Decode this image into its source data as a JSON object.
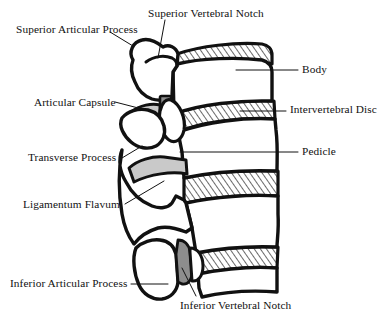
{
  "figure": {
    "background_color": "#ffffff",
    "ink_color": "#111111",
    "labels": [
      {
        "id": "superior-articular-process",
        "text": "Superior Articular Process",
        "x": 16,
        "y": 24,
        "align": "left"
      },
      {
        "id": "superior-vertebral-notch",
        "text": "Superior Vertebral Notch",
        "x": 148,
        "y": 8,
        "align": "left"
      },
      {
        "id": "body",
        "text": "Body",
        "x": 302,
        "y": 64,
        "align": "left"
      },
      {
        "id": "articular-capsule",
        "text": "Articular Capsule",
        "x": 34,
        "y": 97,
        "align": "left"
      },
      {
        "id": "intervertebral-disc",
        "text": "Intervertebral Disc",
        "x": 290,
        "y": 104,
        "align": "left"
      },
      {
        "id": "transverse-process",
        "text": "Transverse Process",
        "x": 28,
        "y": 152,
        "align": "left"
      },
      {
        "id": "pedicle",
        "text": "Pedicle",
        "x": 302,
        "y": 146,
        "align": "left"
      },
      {
        "id": "ligamentum-flavum",
        "text": "Ligamentum Flavum",
        "x": 23,
        "y": 199,
        "align": "left"
      },
      {
        "id": "inferior-articular-process",
        "text": "Inferior Articular Process",
        "x": 10,
        "y": 278,
        "align": "left"
      },
      {
        "id": "inferior-vertebral-notch",
        "text": "Inferior Vertebral Notch",
        "x": 180,
        "y": 300,
        "align": "left"
      }
    ],
    "structures": [
      {
        "id": "vertebral-body-upper",
        "name": "Body"
      },
      {
        "id": "vertebral-body-lower",
        "name": "Body"
      },
      {
        "id": "intervertebral-disc-1",
        "name": "Intervertebral Disc",
        "fill": "hatch"
      },
      {
        "id": "intervertebral-disc-2",
        "name": "Intervertebral Disc",
        "fill": "hatch"
      },
      {
        "id": "intervertebral-disc-3",
        "name": "Intervertebral Disc",
        "fill": "hatch"
      },
      {
        "id": "intervertebral-disc-4",
        "name": "Intervertebral Disc",
        "fill": "hatch"
      },
      {
        "id": "superior-articular-process",
        "name": "Superior Articular Process"
      },
      {
        "id": "inferior-articular-process",
        "name": "Inferior Articular Process"
      },
      {
        "id": "transverse-process",
        "name": "Transverse Process"
      },
      {
        "id": "articular-capsule-1",
        "name": "Articular Capsule",
        "fill": "gray"
      },
      {
        "id": "articular-capsule-2",
        "name": "Articular Capsule",
        "fill": "gray"
      },
      {
        "id": "ligamentum-flavum-1",
        "name": "Ligamentum Flavum",
        "fill": "light-gray"
      },
      {
        "id": "pedicle",
        "name": "Pedicle"
      }
    ]
  }
}
